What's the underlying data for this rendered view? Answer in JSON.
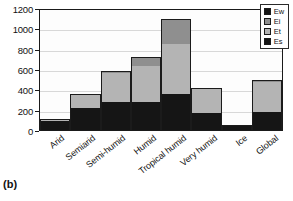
{
  "panel_label": "(b)",
  "legend": {
    "position": "top-right",
    "entries": [
      {
        "label": "Ew",
        "color": "#151515"
      },
      {
        "label": "Ei",
        "color": "#8f8f8f"
      },
      {
        "label": "Et",
        "color": "#b4b4b4"
      },
      {
        "label": "Es",
        "color": "#151515"
      }
    ]
  },
  "chart_data": {
    "type": "bar",
    "stacked": true,
    "title": "",
    "subtitle": "",
    "xlabel": "",
    "ylabel": "",
    "ylim": [
      0,
      1200
    ],
    "yticks": [
      0,
      200,
      400,
      600,
      800,
      1000,
      1200
    ],
    "ytick_labels": [
      "0",
      "200",
      "400",
      "600",
      "800",
      "1000",
      "1200"
    ],
    "grid": true,
    "grid_axis": "y",
    "legend_position": "upper right",
    "categories": [
      "Arid",
      "Semiarid",
      "Semi-humid",
      "Humid",
      "Tropical humid",
      "Very humid",
      "Ice",
      "Global"
    ],
    "series": [
      {
        "name": "Es",
        "color": "#151515",
        "values": [
          90,
          220,
          280,
          280,
          355,
          170,
          45,
          180
        ]
      },
      {
        "name": "Et",
        "color": "#b4b4b4",
        "values": [
          15,
          120,
          280,
          350,
          495,
          230,
          0,
          290
        ]
      },
      {
        "name": "Ei",
        "color": "#8f8f8f",
        "values": [
          5,
          10,
          20,
          85,
          240,
          10,
          0,
          20
        ]
      },
      {
        "name": "Ew",
        "color": "#151515",
        "values": [
          0,
          0,
          0,
          0,
          0,
          0,
          0,
          0
        ]
      }
    ],
    "totals": [
      110,
      350,
      580,
      715,
      1090,
      410,
      45,
      490
    ]
  },
  "axis": {
    "frame_color": "#1a1a1a",
    "grid_color": "#d8d8d8",
    "background": "#fdfdfd"
  }
}
